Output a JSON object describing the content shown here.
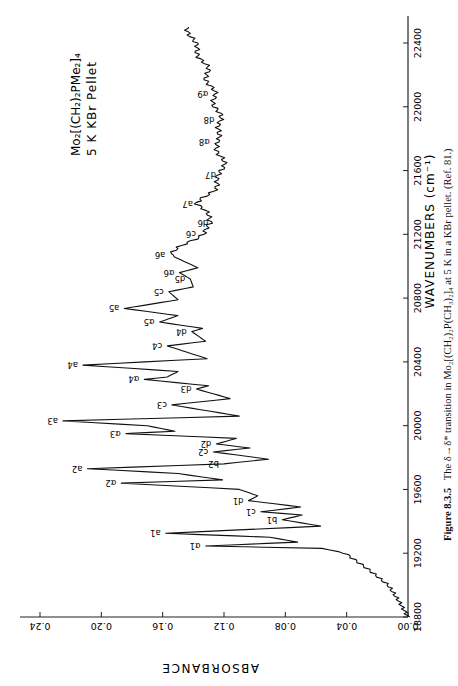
{
  "figure": {
    "number": "Figure 8.3.5",
    "caption": "The δ→δ* transition in Mo₂[(CH₂)₂P(CH₃)₂]₄ at 5 K in a KBr pellet. (Ref. 81.)",
    "inset_line1": "Mo₂[(CH₂)₂PMe₂]₄",
    "inset_line2": "5 K  KBr  Pellet",
    "orientation": "rotated 90° counter-clockwise"
  },
  "chart_data": {
    "type": "line",
    "title": "The δ→δ* transition in Mo₂[(CH₂)₂P(CH₃)₂]₄ at 5 K in a KBr pellet",
    "xlabel": "WAVENUMBERS (cm⁻¹)",
    "ylabel": "ABSORBANCE",
    "xlim": [
      18800,
      22500
    ],
    "ylim": [
      0.0,
      0.24
    ],
    "xticks": [
      18800,
      19200,
      19600,
      20000,
      20400,
      20800,
      21200,
      21600,
      22000,
      22400
    ],
    "yticks": [
      0.0,
      0.04,
      0.08,
      0.12,
      0.16,
      0.2,
      0.24
    ],
    "ytick_labels": [
      "0.00",
      "0.04",
      "0.08",
      "0.12",
      "0.16",
      "0.20",
      "0.24"
    ],
    "grid": false,
    "legend": null,
    "series": [
      {
        "name": "Mo2[(CH2)2PMe2]4, 5 K KBr pellet",
        "x": [
          18800,
          18900,
          19000,
          19100,
          19200,
          19230,
          19245,
          19270,
          19300,
          19325,
          19370,
          19410,
          19440,
          19460,
          19490,
          19530,
          19560,
          19600,
          19640,
          19660,
          19700,
          19730,
          19760,
          19790,
          19835,
          19860,
          19885,
          19920,
          19950,
          19965,
          20000,
          20030,
          20060,
          20130,
          20170,
          20230,
          20250,
          20290,
          20305,
          20340,
          20380,
          20420,
          20500,
          20530,
          20590,
          20610,
          20650,
          20690,
          20735,
          20790,
          20840,
          20870,
          20920,
          20960,
          20990,
          21070,
          21140,
          21200,
          21270,
          21330,
          21390,
          21470,
          21570,
          21680,
          21780,
          21850,
          21920,
          22000,
          22080,
          22160,
          22250,
          22330,
          22400,
          22500
        ],
        "values": [
          0.0,
          0.006,
          0.013,
          0.026,
          0.041,
          0.056,
          0.132,
          0.072,
          0.09,
          0.158,
          0.057,
          0.082,
          0.069,
          0.096,
          0.07,
          0.104,
          0.098,
          0.11,
          0.187,
          0.121,
          0.15,
          0.209,
          0.12,
          0.091,
          0.127,
          0.103,
          0.125,
          0.112,
          0.184,
          0.152,
          0.17,
          0.225,
          0.11,
          0.154,
          0.116,
          0.138,
          0.13,
          0.172,
          0.157,
          0.15,
          0.212,
          0.131,
          0.157,
          0.132,
          0.141,
          0.134,
          0.162,
          0.15,
          0.185,
          0.15,
          0.156,
          0.14,
          0.142,
          0.149,
          0.137,
          0.155,
          0.145,
          0.135,
          0.127,
          0.132,
          0.137,
          0.128,
          0.122,
          0.121,
          0.126,
          0.122,
          0.123,
          0.125,
          0.127,
          0.13,
          0.132,
          0.136,
          0.14,
          0.143
        ]
      }
    ],
    "annotations": [
      {
        "label": "α1",
        "x": 19245,
        "y": 0.132
      },
      {
        "label": "a1",
        "x": 19325,
        "y": 0.158
      },
      {
        "label": "b1",
        "x": 19410,
        "y": 0.082
      },
      {
        "label": "c1",
        "x": 19460,
        "y": 0.096
      },
      {
        "label": "d1",
        "x": 19530,
        "y": 0.104
      },
      {
        "label": "α2",
        "x": 19640,
        "y": 0.187
      },
      {
        "label": "a2",
        "x": 19730,
        "y": 0.209
      },
      {
        "label": "b2",
        "x": 19760,
        "y": 0.12
      },
      {
        "label": "c2",
        "x": 19835,
        "y": 0.127
      },
      {
        "label": "d2",
        "x": 19885,
        "y": 0.125
      },
      {
        "label": "α3",
        "x": 19950,
        "y": 0.184
      },
      {
        "label": "a3",
        "x": 20030,
        "y": 0.225
      },
      {
        "label": "c3",
        "x": 20130,
        "y": 0.154
      },
      {
        "label": "d3",
        "x": 20230,
        "y": 0.138
      },
      {
        "label": "α4",
        "x": 20290,
        "y": 0.172
      },
      {
        "label": "a4",
        "x": 20380,
        "y": 0.212
      },
      {
        "label": "c4",
        "x": 20500,
        "y": 0.157
      },
      {
        "label": "d4",
        "x": 20590,
        "y": 0.141
      },
      {
        "label": "α5",
        "x": 20650,
        "y": 0.162
      },
      {
        "label": "a5",
        "x": 20735,
        "y": 0.185
      },
      {
        "label": "c5",
        "x": 20840,
        "y": 0.156
      },
      {
        "label": "d5",
        "x": 20920,
        "y": 0.142
      },
      {
        "label": "α6",
        "x": 20960,
        "y": 0.149
      },
      {
        "label": "a6",
        "x": 21070,
        "y": 0.155
      },
      {
        "label": "c6",
        "x": 21200,
        "y": 0.135
      },
      {
        "label": "d6",
        "x": 21270,
        "y": 0.127
      },
      {
        "label": "a7",
        "x": 21390,
        "y": 0.137
      },
      {
        "label": "d7",
        "x": 21570,
        "y": 0.122
      },
      {
        "label": "α8",
        "x": 21780,
        "y": 0.126
      },
      {
        "label": "d8",
        "x": 21920,
        "y": 0.123
      },
      {
        "label": "α9",
        "x": 22080,
        "y": 0.127
      }
    ]
  }
}
